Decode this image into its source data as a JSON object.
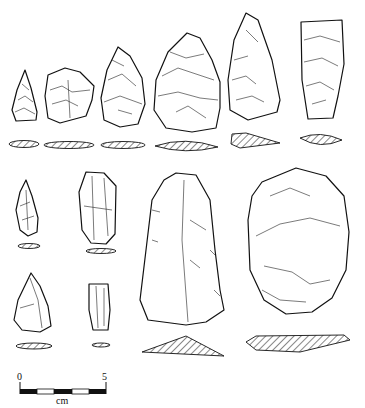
{
  "figure": {
    "type": "archaeological lithic artifact drawing plate",
    "artifacts": [
      {
        "id": 1,
        "row": "top",
        "shape": "small point"
      },
      {
        "id": 2,
        "row": "top",
        "shape": "scraper"
      },
      {
        "id": 3,
        "row": "top",
        "shape": "ovate biface"
      },
      {
        "id": 4,
        "row": "top",
        "shape": "large biface"
      },
      {
        "id": 5,
        "row": "top",
        "shape": "pointed blade"
      },
      {
        "id": 6,
        "row": "top",
        "shape": "rectangular blade"
      },
      {
        "id": 7,
        "row": "middle",
        "shape": "small flake"
      },
      {
        "id": 8,
        "row": "middle",
        "shape": "blade fragment"
      },
      {
        "id": 9,
        "row": "bottom",
        "shape": "triangular flake"
      },
      {
        "id": 10,
        "row": "bottom",
        "shape": "small blade"
      },
      {
        "id": 11,
        "row": "large",
        "shape": "large elongated flake"
      },
      {
        "id": 12,
        "row": "large",
        "shape": "ovate core tool"
      }
    ]
  },
  "scale_bar": {
    "start_label": "0",
    "end_label": "5",
    "unit_label": "cm",
    "segments": 5
  }
}
